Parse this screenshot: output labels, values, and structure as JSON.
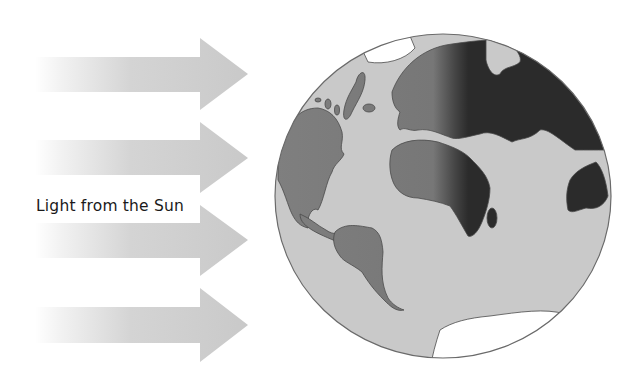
{
  "diagram": {
    "label": "Light from the Sun",
    "arrows": [
      {
        "name": "arrow-1"
      },
      {
        "name": "arrow-2"
      },
      {
        "name": "arrow-3"
      },
      {
        "name": "arrow-4"
      }
    ],
    "globe": {
      "day_side": "west",
      "night_side": "east",
      "continents_visible": [
        "North America",
        "South America",
        "Greenland",
        "Europe",
        "Africa",
        "Asia",
        "Australia",
        "Antarctica"
      ]
    },
    "colors": {
      "arrow": "#c8c8c8",
      "ocean": "#c9c9c9",
      "land_day": "#888888",
      "land_night": "#2b2b2b",
      "ice": "#ffffff",
      "outline": "#555555"
    }
  }
}
